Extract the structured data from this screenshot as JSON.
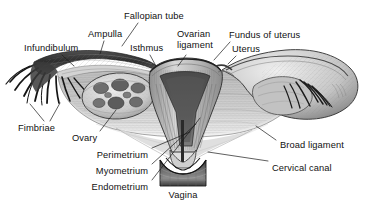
{
  "figure": {
    "background_color": "#ffffff",
    "ink_color": "#111111",
    "style": "grayscale pen-and-ink anatomical engraving"
  },
  "labels": [
    {
      "id": "fallopian-tube",
      "text": "Fallopian tube",
      "x": 124,
      "y": 11,
      "align": "left"
    },
    {
      "id": "ampulla",
      "text": "Ampulla",
      "x": 88,
      "y": 29,
      "align": "left"
    },
    {
      "id": "infundibulum",
      "text": "Infundibulum",
      "x": 24,
      "y": 43,
      "align": "left"
    },
    {
      "id": "isthmus",
      "text": "Isthmus",
      "x": 130,
      "y": 43,
      "align": "left"
    },
    {
      "id": "ovarian-ligament",
      "text": "Ovarian\nligament",
      "x": 177,
      "y": 29,
      "align": "left"
    },
    {
      "id": "fundus-of-uterus",
      "text": "Fundus of uterus",
      "x": 229,
      "y": 30,
      "align": "left"
    },
    {
      "id": "uterus",
      "text": "Uterus",
      "x": 232,
      "y": 44,
      "align": "left"
    },
    {
      "id": "fimbriae",
      "text": "Fimbriae",
      "x": 18,
      "y": 123,
      "align": "left"
    },
    {
      "id": "ovary",
      "text": "Ovary",
      "x": 72,
      "y": 133,
      "align": "left"
    },
    {
      "id": "perimetrium",
      "text": "Perimetrium",
      "x": 148,
      "y": 150,
      "align": "right"
    },
    {
      "id": "myometrium",
      "text": "Myometrium",
      "x": 148,
      "y": 166,
      "align": "right"
    },
    {
      "id": "endometrium",
      "text": "Endometrium",
      "x": 148,
      "y": 182,
      "align": "right"
    },
    {
      "id": "broad-ligament",
      "text": "Broad ligament",
      "x": 280,
      "y": 140,
      "align": "left"
    },
    {
      "id": "cervical-canal",
      "text": "Cervical canal",
      "x": 272,
      "y": 163,
      "align": "left"
    },
    {
      "id": "vagina",
      "text": "Vagina",
      "x": 183,
      "y": 190,
      "align": "center"
    }
  ],
  "leader_lines": [
    {
      "id": "leader-fallopian-tube",
      "points": "138,23 122,46"
    },
    {
      "id": "leader-ampulla",
      "points": "104,41 100,54"
    },
    {
      "id": "leader-infundibulum",
      "points": "62,55 74,66"
    },
    {
      "id": "leader-isthmus",
      "points": "150,55 156,66"
    },
    {
      "id": "leader-ovarian-ligament",
      "points": "186,55 178,66"
    },
    {
      "id": "leader-fundus",
      "points": "230,42 214,60"
    },
    {
      "id": "leader-uterus",
      "points": "236,56 228,64"
    },
    {
      "id": "leader-fimbriae-a",
      "points": "44,121 30,104"
    },
    {
      "id": "leader-fimbriae-b",
      "points": "50,121 60,103"
    },
    {
      "id": "leader-ovary",
      "points": "100,131 116,110"
    },
    {
      "id": "leader-perimetrium",
      "points": "152,148 190,132"
    },
    {
      "id": "leader-myometrium",
      "points": "152,164 196,124"
    },
    {
      "id": "leader-endometrium",
      "points": "152,180 200,118"
    },
    {
      "id": "leader-broad-ligament",
      "points": "276,140 256,126"
    },
    {
      "id": "leader-cervical-canal",
      "points": "268,161 208,152"
    }
  ],
  "anatomy_parts": [
    {
      "id": "left-fallopian-tube",
      "name": "left fallopian tube"
    },
    {
      "id": "left-fimbriae",
      "name": "left fimbriae"
    },
    {
      "id": "left-ovary",
      "name": "left ovary with follicles"
    },
    {
      "id": "uterus-body",
      "name": "uterus body"
    },
    {
      "id": "uterine-cavity",
      "name": "uterine cavity"
    },
    {
      "id": "cervix",
      "name": "cervix"
    },
    {
      "id": "vagina-canal",
      "name": "vagina"
    },
    {
      "id": "right-fallopian-tube",
      "name": "right fallopian tube"
    },
    {
      "id": "right-fimbriae",
      "name": "right fimbriae"
    },
    {
      "id": "right-ovary",
      "name": "right ovary"
    },
    {
      "id": "broad-ligament-sheet",
      "name": "broad ligament"
    }
  ]
}
